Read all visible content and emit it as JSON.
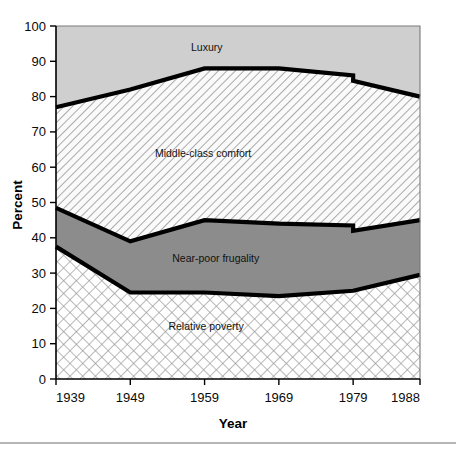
{
  "chart_data": {
    "type": "area",
    "title": "",
    "subtitle": "",
    "xlabel": "Year",
    "ylabel": "Percent",
    "x": [
      1939,
      1949,
      1959,
      1969,
      1979,
      1988
    ],
    "categories": [
      "1939",
      "1949",
      "1959",
      "1969",
      "1979",
      "1988"
    ],
    "xtick_labels": [
      "1939",
      "1949",
      "1959",
      "1969",
      "1979",
      "1988"
    ],
    "ytick_labels": [
      "0",
      "10",
      "20",
      "30",
      "40",
      "50",
      "60",
      "70",
      "80",
      "90",
      "100"
    ],
    "yticks": [
      0,
      10,
      20,
      30,
      40,
      50,
      60,
      70,
      80,
      90,
      100
    ],
    "ylim": [
      0,
      100
    ],
    "xlim": [
      1939,
      1988
    ],
    "grid": false,
    "legend_position": "inline-labels",
    "stacked": true,
    "series_break_year": 1979,
    "series": [
      {
        "name": "Relative poverty",
        "fill": "cross-hatch",
        "values": [
          37.5,
          24.5,
          24.5,
          23.5,
          25.0,
          29.5
        ],
        "values_after_break": [
          null,
          null,
          null,
          null,
          26.0,
          29.5
        ],
        "cumulative_top": [
          37.5,
          24.5,
          24.5,
          23.5,
          25.0,
          29.5
        ]
      },
      {
        "name": "Near-poor frugality",
        "fill": "solid-gray",
        "values": [
          11.0,
          14.5,
          20.5,
          20.5,
          18.5,
          15.5
        ],
        "cumulative_top": [
          48.5,
          39.0,
          45.0,
          44.0,
          43.5,
          45.0
        ],
        "cumulative_top_after_break": [
          null,
          null,
          null,
          null,
          42.0,
          45.0
        ]
      },
      {
        "name": "Middle-class comfort",
        "fill": "diagonal-hatch",
        "values": [
          28.5,
          43.0,
          43.0,
          44.0,
          42.5,
          35.0
        ],
        "cumulative_top": [
          77.0,
          82.0,
          88.0,
          88.0,
          86.0,
          80.0
        ],
        "cumulative_top_after_break": [
          null,
          null,
          null,
          null,
          84.5,
          80.0
        ]
      },
      {
        "name": "Luxury",
        "fill": "light-gray",
        "values": [
          23.0,
          18.0,
          12.0,
          12.0,
          14.0,
          20.0
        ],
        "cumulative_top": [
          100,
          100,
          100,
          100,
          100,
          100
        ]
      }
    ],
    "band_labels": [
      {
        "text": "Luxury",
        "x": 1959.3,
        "y": 94.0
      },
      {
        "text": "Middle-class comfort",
        "x": 1958.8,
        "y": 64.0
      },
      {
        "text": "Near-poor frugality",
        "x": 1960.5,
        "y": 34.0
      },
      {
        "text": "Relative poverty",
        "x": 1959.2,
        "y": 15.0
      }
    ]
  },
  "axes": {
    "y_title": "Percent",
    "x_title": "Year"
  },
  "colors": {
    "luxury_fill": "#cfcfcf",
    "near_poor_fill": "#8c8c8c",
    "middle_class_fill": "#f2f2f2",
    "poverty_fill": "#fbfbfb",
    "boundary_line": "#000000",
    "axis": "#000000",
    "frame": "#7a7a7a",
    "text": "#0a0a0a"
  },
  "footer": {
    "note": ""
  }
}
